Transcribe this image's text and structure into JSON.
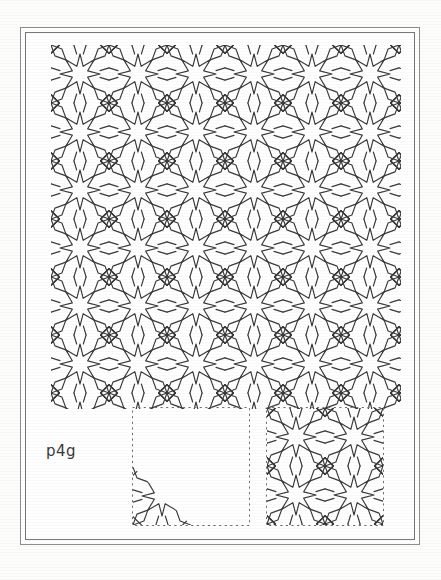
{
  "figure": {
    "label": "p4g",
    "background_color": "#ffffff",
    "ink_color": "#3a3a3a",
    "frame_color": "#8e8e8e"
  },
  "main_pattern": {
    "name": "islamic-eight-point-star-interlace",
    "description": "Repeating 8-pointed star interlace filling the upper plate",
    "x": 51,
    "y": 45,
    "width": 350,
    "height": 364,
    "cell_size": 58,
    "columns": 6,
    "rows": 6.3,
    "stroke_color": "#3a3a3a",
    "stroke_width": 1.15
  },
  "panels": [
    {
      "name": "fundamental-domain",
      "caption": "",
      "x": 132,
      "y": 407,
      "width": 117,
      "height": 118,
      "border_style": "dashed",
      "border_color": "#6f6f6f",
      "contains": "motif-fragment-lower-left"
    },
    {
      "name": "unit-cell",
      "caption": "",
      "x": 266,
      "y": 407,
      "width": 117,
      "height": 118,
      "border_style": "dashed",
      "border_color": "#6f6f6f",
      "contains": "full-star-interlace-cell"
    }
  ],
  "geometry": {
    "star_points": 8,
    "symmetry_group": "p4g",
    "lattice": "square"
  }
}
